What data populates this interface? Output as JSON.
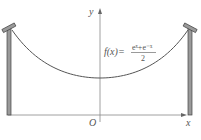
{
  "diagram": {
    "function": {
      "lhs": "f(x)=",
      "numerator": "eˣ+e⁻ˣ",
      "denominator": "2"
    },
    "axes": {
      "x_label": "x",
      "y_label": "y",
      "origin_label": "O"
    },
    "colors": {
      "line": "#555555",
      "pole_fill": "#8a8a8a",
      "axis": "#777777"
    }
  }
}
